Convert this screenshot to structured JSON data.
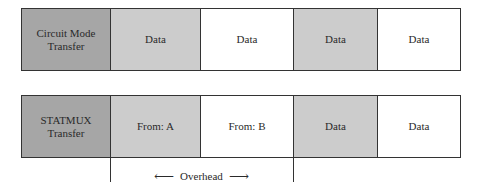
{
  "colors": {
    "label_fill": "#a6a6a6",
    "shaded_fill": "#cccccc",
    "plain_fill": "#ffffff",
    "border": "#333333"
  },
  "rows": [
    {
      "label": [
        "Circuit Mode",
        "Transfer"
      ],
      "cells": [
        {
          "text": "Data",
          "shaded": true
        },
        {
          "text": "Data",
          "shaded": false
        },
        {
          "text": "Data",
          "shaded": true
        },
        {
          "text": "Data",
          "shaded": false
        }
      ]
    },
    {
      "label": [
        "STATMUX",
        "Transfer"
      ],
      "cells": [
        {
          "text": "From: A",
          "shaded": true
        },
        {
          "text": "From: B",
          "shaded": false
        },
        {
          "text": "Data",
          "shaded": true
        },
        {
          "text": "Data",
          "shaded": false
        }
      ]
    }
  ],
  "annotation": {
    "label": "Overhead",
    "left_arrow": "⟵",
    "right_arrow": "⟶"
  }
}
